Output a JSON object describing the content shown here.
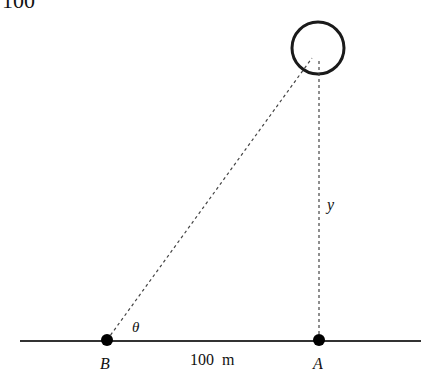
{
  "diagram": {
    "top_clipped_text": "100",
    "balloon": {
      "label": "",
      "shape": "circle"
    },
    "points": {
      "A": {
        "label": "A"
      },
      "B": {
        "label": "B"
      }
    },
    "labels": {
      "height": "y",
      "angle": "θ",
      "distance": "100  m"
    },
    "colors": {
      "line": "#222222",
      "dash": "#444444",
      "point": "#000000"
    }
  }
}
